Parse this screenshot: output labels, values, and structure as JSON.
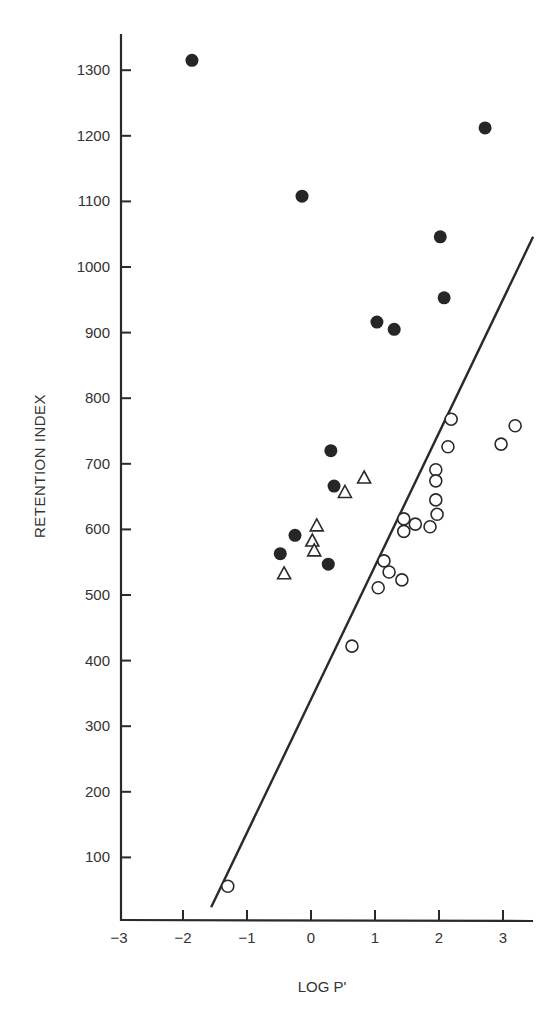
{
  "chart_data": {
    "type": "scatter",
    "title": "",
    "xlabel": "LOG P'",
    "ylabel": "RETENTION INDEX",
    "xlim": [
      -3,
      3.4
    ],
    "ylim": [
      0,
      1350
    ],
    "xticks": [
      -3,
      -2,
      -1,
      0,
      1,
      2,
      3
    ],
    "xtick_labels": [
      "−3",
      "−2",
      "−1",
      "0",
      "1",
      "2",
      "3"
    ],
    "yticks": [
      100,
      200,
      300,
      400,
      500,
      600,
      700,
      800,
      900,
      1000,
      1100,
      1200,
      1300
    ],
    "ytick_labels": [
      "100",
      "200",
      "300",
      "400",
      "500",
      "600",
      "700",
      "800",
      "900",
      "1000",
      "1100",
      "1200",
      "1300"
    ],
    "grid": false,
    "legend": null,
    "series": [
      {
        "name": "filled circles",
        "marker": "filled-circle",
        "points": [
          [
            -1.86,
            1315
          ],
          [
            2.72,
            1212
          ],
          [
            -0.14,
            1108
          ],
          [
            2.02,
            1046
          ],
          [
            2.08,
            953
          ],
          [
            1.03,
            916
          ],
          [
            1.3,
            905
          ],
          [
            0.31,
            720
          ],
          [
            0.36,
            666
          ],
          [
            -0.25,
            591
          ],
          [
            -0.48,
            563
          ],
          [
            0.27,
            547
          ]
        ]
      },
      {
        "name": "open triangles",
        "marker": "open-triangle",
        "points": [
          [
            0.83,
            678
          ],
          [
            0.53,
            656
          ],
          [
            0.09,
            605
          ],
          [
            0.02,
            582
          ],
          [
            0.05,
            567
          ],
          [
            -0.42,
            532
          ]
        ]
      },
      {
        "name": "open circles",
        "marker": "open-circle",
        "points": [
          [
            2.19,
            768
          ],
          [
            3.19,
            758
          ],
          [
            2.14,
            726
          ],
          [
            2.97,
            730
          ],
          [
            1.95,
            691
          ],
          [
            1.95,
            674
          ],
          [
            1.95,
            645
          ],
          [
            1.97,
            623
          ],
          [
            1.45,
            616
          ],
          [
            1.63,
            608
          ],
          [
            1.45,
            597
          ],
          [
            1.86,
            604
          ],
          [
            1.14,
            552
          ],
          [
            1.22,
            535
          ],
          [
            1.42,
            523
          ],
          [
            1.05,
            511
          ],
          [
            0.64,
            422
          ],
          [
            -1.3,
            56
          ]
        ]
      }
    ],
    "regression_line": {
      "x1": -1.56,
      "y1": 24,
      "x2": 3.47,
      "y2": 1046
    }
  },
  "labels": {
    "ylabel": "RETENTION INDEX",
    "xlabel": "LOG P'"
  }
}
